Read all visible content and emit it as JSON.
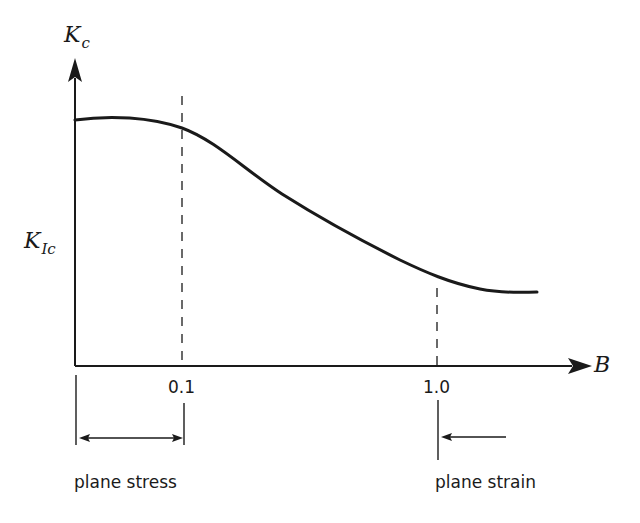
{
  "diagram": {
    "y_axis": {
      "symbol": "K",
      "subscript": "c"
    },
    "x_axis": {
      "symbol": "B"
    },
    "y_marker": {
      "symbol": "K",
      "subscript": "Ic"
    },
    "x_ticks": [
      {
        "label": "0.1"
      },
      {
        "label": "1.0"
      }
    ],
    "regions": {
      "left": {
        "label": "plane stress"
      },
      "right": {
        "label": "plane strain"
      }
    },
    "colors": {
      "ink": "#1a1a1a",
      "background": "#ffffff"
    }
  }
}
